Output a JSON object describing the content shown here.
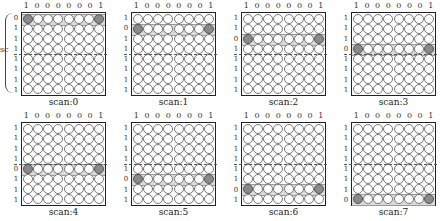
{
  "figure": {
    "column_bits": [
      "1",
      "0",
      "0",
      "0",
      "0",
      "0",
      "0",
      "1"
    ],
    "side_label": "sc",
    "grid_size": 8,
    "panels": [
      {
        "label": "scan:0",
        "row_bits": [
          "0",
          "1",
          "1",
          "1",
          "1",
          "1",
          "1",
          "1"
        ],
        "active_row": 0
      },
      {
        "label": "scan:1",
        "row_bits": [
          "1",
          "0",
          "1",
          "1",
          "1",
          "1",
          "1",
          "1"
        ],
        "active_row": 1
      },
      {
        "label": "scan:2",
        "row_bits": [
          "1",
          "1",
          "0",
          "1",
          "1",
          "1",
          "1",
          "1"
        ],
        "active_row": 2
      },
      {
        "label": "scan:3",
        "row_bits": [
          "1",
          "1",
          "1",
          "0",
          "1",
          "1",
          "1",
          "1"
        ],
        "active_row": 3
      },
      {
        "label": "scan:4",
        "row_bits": [
          "1",
          "1",
          "1",
          "1",
          "0",
          "1",
          "1",
          "1"
        ],
        "active_row": 4
      },
      {
        "label": "scan:5",
        "row_bits": [
          "1",
          "1",
          "1",
          "1",
          "1",
          "0",
          "1",
          "1"
        ],
        "active_row": 5
      },
      {
        "label": "scan:6",
        "row_bits": [
          "1",
          "1",
          "1",
          "1",
          "1",
          "1",
          "0",
          "1"
        ],
        "active_row": 6
      },
      {
        "label": "scan:7",
        "row_bits": [
          "1",
          "1",
          "1",
          "1",
          "1",
          "1",
          "1",
          "0"
        ],
        "active_row": 7
      }
    ],
    "colors": {
      "led_on": "#8a8a8a",
      "led_off": "#ffffff",
      "border": "#222222",
      "highlight": "#c8c8c8"
    }
  }
}
